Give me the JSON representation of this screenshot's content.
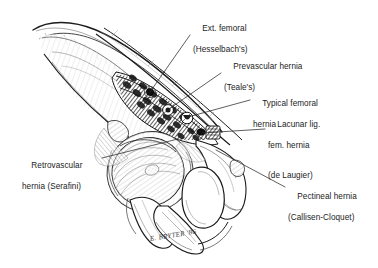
{
  "figure": {
    "background_color": "#ffffff",
    "ink_color": "#1b1b1b",
    "artist_signature": "E. BRYTER '86"
  },
  "annotations": [
    {
      "id": "ext-femoral",
      "name": "Ext. femoral (Hesselbach's)",
      "line1": "Ext. femoral",
      "line2": "(Hesselbach's)",
      "leader_from": [
        191,
        34
      ],
      "leader_to": [
        149,
        92
      ]
    },
    {
      "id": "prevascular",
      "name": "Prevascular hernia (Teale's)",
      "line1": "Prevascular hernia",
      "line2": "(Teale's)",
      "leader_from": [
        222,
        72
      ],
      "leader_to": [
        167,
        110
      ]
    },
    {
      "id": "typical-femoral",
      "name": "Typical femoral hernia",
      "line1": "Typical femoral",
      "line2": "hernia",
      "leader_from": [
        251,
        99
      ],
      "leader_to": [
        186,
        117
      ]
    },
    {
      "id": "lacunar",
      "name": "Lacunar lig. fem. hernia (de Laugier)",
      "line1": "Lacunar lig.",
      "line2": "fem. hernia",
      "line3": "(de Laugier)",
      "leader_from": [
        266,
        128
      ],
      "leader_to": [
        200,
        134
      ]
    },
    {
      "id": "retrovascular",
      "name": "Retrovascular hernia (Serafini)",
      "line1": "Retrovascular",
      "line2": "hernia (Serafini)",
      "leader_from": [
        100,
        158
      ],
      "leader_to": [
        176,
        140
      ]
    },
    {
      "id": "pectineal",
      "name": "Pectineal hernia (Callisen-Cloquet)",
      "line1": "Pectineal hernia",
      "line2": "(Callisen-Cloquet)",
      "leader_from": [
        286,
        186
      ],
      "leader_to": [
        214,
        150
      ]
    }
  ],
  "hernia_markers": [
    {
      "id": "marker-ext-femoral",
      "cx": 150,
      "cy": 92,
      "r": 3.0,
      "filled": true
    },
    {
      "id": "marker-prevascular",
      "cx": 168,
      "cy": 110,
      "r": 5.2,
      "filled": false
    },
    {
      "id": "marker-typical",
      "cx": 187,
      "cy": 118,
      "r": 5.6,
      "filled": false
    },
    {
      "id": "marker-lacunar",
      "cx": 201,
      "cy": 132,
      "r": 3.4,
      "filled": true
    }
  ],
  "structures": [
    {
      "id": "iliac-crest",
      "label": "Iliac crest"
    },
    {
      "id": "iliac-fossa",
      "label": "Iliac fossa"
    },
    {
      "id": "inguinal-ligament",
      "label": "Inguinal ligament"
    },
    {
      "id": "pectineal-muscle",
      "label": "Hatched muscle band"
    },
    {
      "id": "femoral-head",
      "label": "Femoral head"
    },
    {
      "id": "acetabulum",
      "label": "Acetabulum"
    },
    {
      "id": "obturator-foramen",
      "label": "Obturator foramen"
    },
    {
      "id": "pubic-ramus",
      "label": "Superior pubic ramus"
    },
    {
      "id": "ischial-tuberosity",
      "label": "Ischial tuberosity"
    },
    {
      "id": "greater-trochanter",
      "label": "Greater trochanter"
    }
  ]
}
